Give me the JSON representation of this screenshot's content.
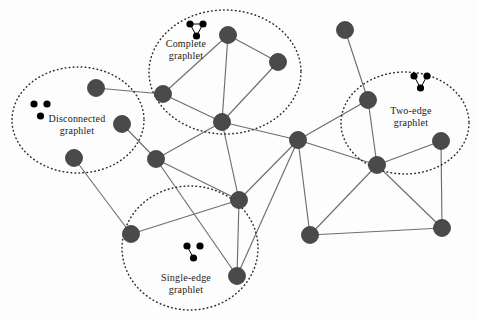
{
  "figure": {
    "background_color": "#fdfdfd",
    "node_color": "#4a4a4a",
    "node_stroke_color": "#3a3a3a",
    "edge_color": "#6e6e6e",
    "ellipse_color": "#2b2b2b",
    "icon_node_color": "#000000"
  },
  "graphlets": [
    {
      "id": "complete",
      "label_line1": "Complete",
      "label_line2": "graphlet",
      "icon_type": "triangle-three-edges",
      "label_x": 186,
      "label_y": 38,
      "icon_x": 190,
      "icon_y": 24,
      "ellipse_cx": 225,
      "ellipse_cy": 72,
      "ellipse_rx": 76,
      "ellipse_ry": 62
    },
    {
      "id": "disconnected",
      "label_line1": "Disconnected",
      "label_line2": "graphlet",
      "icon_type": "three-isolated-dots",
      "label_x": 77,
      "label_y": 113,
      "icon_x": 34,
      "icon_y": 104,
      "ellipse_cx": 78,
      "ellipse_cy": 120,
      "ellipse_rx": 66,
      "ellipse_ry": 53
    },
    {
      "id": "two-edge",
      "label_line1": "Two-edge",
      "label_line2": "graphlet",
      "icon_type": "v-two-edges",
      "label_x": 411,
      "label_y": 105,
      "icon_x": 414,
      "icon_y": 76,
      "ellipse_cx": 405,
      "ellipse_cy": 123,
      "ellipse_rx": 64,
      "ellipse_ry": 51
    },
    {
      "id": "single-edge",
      "label_line1": "Single-edge",
      "label_line2": "graphlet",
      "icon_type": "one-edge-two-dots",
      "label_x": 186,
      "label_y": 272,
      "icon_x": 187,
      "icon_y": 246,
      "ellipse_cx": 190,
      "ellipse_cy": 248,
      "ellipse_rx": 68,
      "ellipse_ry": 62
    }
  ],
  "chart_data": {
    "type": "diagram-graph",
    "node_radius": 8.5,
    "nodes": [
      {
        "id": "n1",
        "x": 96,
        "y": 88
      },
      {
        "id": "n2",
        "x": 122,
        "y": 124
      },
      {
        "id": "n3",
        "x": 74,
        "y": 158
      },
      {
        "id": "n4",
        "x": 163,
        "y": 94
      },
      {
        "id": "n5",
        "x": 228,
        "y": 35
      },
      {
        "id": "n6",
        "x": 278,
        "y": 62
      },
      {
        "id": "n7",
        "x": 222,
        "y": 122
      },
      {
        "id": "n8",
        "x": 156,
        "y": 159
      },
      {
        "id": "n9",
        "x": 131,
        "y": 234
      },
      {
        "id": "n10",
        "x": 239,
        "y": 200
      },
      {
        "id": "n11",
        "x": 237,
        "y": 276
      },
      {
        "id": "n12",
        "x": 298,
        "y": 140
      },
      {
        "id": "n13",
        "x": 345,
        "y": 30
      },
      {
        "id": "n14",
        "x": 368,
        "y": 100
      },
      {
        "id": "n15",
        "x": 377,
        "y": 165
      },
      {
        "id": "n16",
        "x": 441,
        "y": 141
      },
      {
        "id": "n17",
        "x": 310,
        "y": 235
      },
      {
        "id": "n18",
        "x": 442,
        "y": 228
      }
    ],
    "edges": [
      [
        "n1",
        "n4"
      ],
      [
        "n2",
        "n8"
      ],
      [
        "n3",
        "n9"
      ],
      [
        "n4",
        "n5"
      ],
      [
        "n4",
        "n7"
      ],
      [
        "n5",
        "n6"
      ],
      [
        "n5",
        "n7"
      ],
      [
        "n6",
        "n7"
      ],
      [
        "n7",
        "n8"
      ],
      [
        "n7",
        "n10"
      ],
      [
        "n7",
        "n12"
      ],
      [
        "n8",
        "n10"
      ],
      [
        "n8",
        "n11"
      ],
      [
        "n9",
        "n10"
      ],
      [
        "n10",
        "n11"
      ],
      [
        "n10",
        "n12"
      ],
      [
        "n12",
        "n14"
      ],
      [
        "n12",
        "n15"
      ],
      [
        "n12",
        "n17"
      ],
      [
        "n12",
        "n11"
      ],
      [
        "n13",
        "n14"
      ],
      [
        "n14",
        "n15"
      ],
      [
        "n15",
        "n16"
      ],
      [
        "n15",
        "n17"
      ],
      [
        "n15",
        "n18"
      ],
      [
        "n16",
        "n18"
      ],
      [
        "n17",
        "n18"
      ]
    ]
  }
}
